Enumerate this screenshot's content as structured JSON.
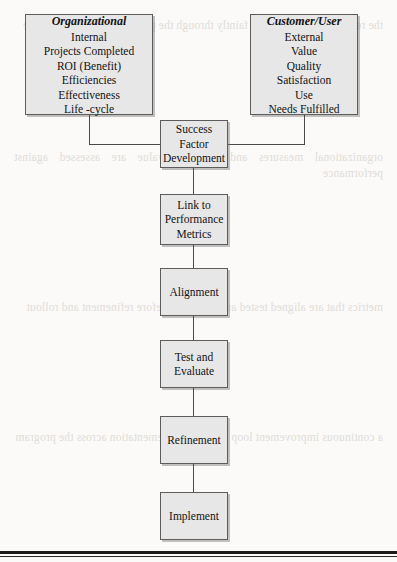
{
  "diagram": {
    "type": "flowchart",
    "source_boxes": [
      {
        "id": "organizational",
        "header": "Organizational",
        "items": [
          "Internal",
          "Projects Completed",
          "ROI (Benefit)",
          "Efficiencies",
          "Effectiveness",
          "Life -cycle"
        ]
      },
      {
        "id": "customer-user",
        "header": "Customer/User",
        "items": [
          "External",
          "Value",
          "Quality",
          "Satisfaction",
          "Use",
          "Needs Fulfilled"
        ]
      }
    ],
    "flow_steps": [
      {
        "id": "success-factor-development",
        "lines": [
          "Success",
          "Factor",
          "Development"
        ]
      },
      {
        "id": "link-to-performance-metrics",
        "lines": [
          "Link to",
          "Performance",
          "Metrics"
        ]
      },
      {
        "id": "alignment",
        "lines": [
          "Alignment"
        ]
      },
      {
        "id": "test-and-evaluate",
        "lines": [
          "Test and",
          "Evaluate"
        ]
      },
      {
        "id": "refinement",
        "lines": [
          "Refinement"
        ]
      },
      {
        "id": "implement",
        "lines": [
          "Implement"
        ]
      }
    ],
    "colors": {
      "box_fill": "#e7e7e7",
      "box_border": "#5c5c5c",
      "connector": "#4a4a4a",
      "page_background": "#fbfaf8",
      "rule": "#1c1c1c"
    }
  },
  "background_bleed": {
    "block_1": "the reverse page text shows faintly through the paper in this scanned figure",
    "block_2": "organizational measures and customer value are assessed against performance",
    "block_3": "metrics that are aligned tested and evaluated before refinement and rollout",
    "block_4": "a continuous improvement loop supports implementation across the program"
  }
}
